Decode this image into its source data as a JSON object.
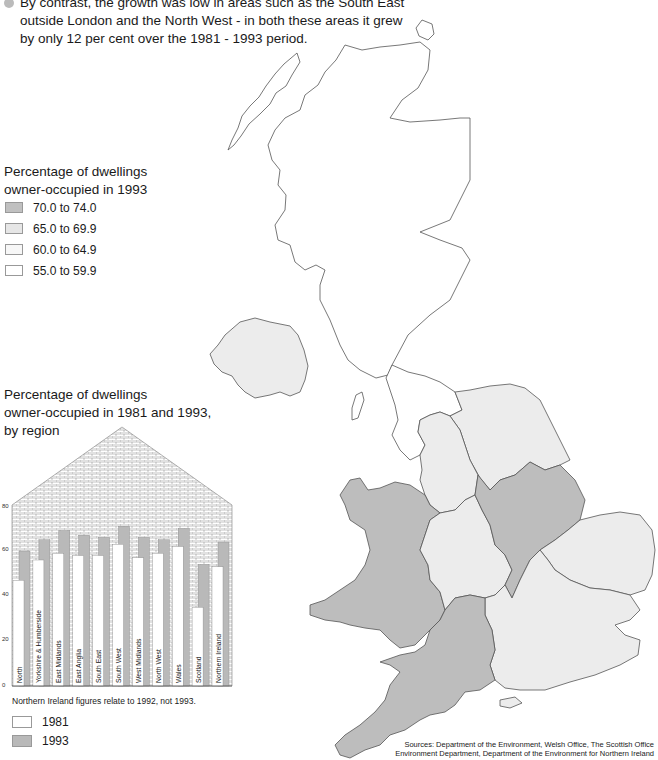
{
  "intro": {
    "lines": [
      "By contrast, the growth was low in areas such as the South East",
      "outside London and the North West - in both these areas it grew",
      "by only 12 per cent over the 1981 - 1993 period."
    ]
  },
  "map_legend": {
    "title_line1": "Percentage of dwellings",
    "title_line2": "owner-occupied in 1993",
    "items": [
      {
        "label": "70.0 to 74.0",
        "color": "#c0c0c0"
      },
      {
        "label": "65.0 to 69.9",
        "color": "#e6e6e6"
      },
      {
        "label": "60.0 to 64.9",
        "color": "#f7f7f7"
      },
      {
        "label": "55.0 to 59.9",
        "color": "#ffffff"
      }
    ]
  },
  "map": {
    "region_colors": {
      "dark": "#bdbdbd",
      "light": "#ececec",
      "white": "#ffffff",
      "outline": "#555555"
    }
  },
  "chart_title": {
    "line1": "Percentage of dwellings",
    "line2": "owner-occupied in 1981 and 1993,",
    "line3": "by region"
  },
  "chart_note": "Northern Ireland figures relate to 1992, not 1993.",
  "chart_legend": [
    {
      "label": "1981",
      "color": "#ffffff"
    },
    {
      "label": "1993",
      "color": "#b9b9b9"
    }
  ],
  "sources": {
    "line1": "Sources: Department of the Environment, Welsh Office, The Scottish Office",
    "line2": "Environment Department, Department of the Environment for Northern Ireland"
  },
  "chart_data": {
    "type": "bar",
    "title": "Percentage of dwellings owner-occupied in 1981 and 1993, by region",
    "xlabel": "",
    "ylabel": "",
    "ylim": [
      0,
      80
    ],
    "yticks": [
      0,
      20,
      40,
      60,
      80
    ],
    "grid": false,
    "legend_position": "bottom-left",
    "categories": [
      "North",
      "Yorkshire & Humberside",
      "East Midlands",
      "East Anglia",
      "South East",
      "South West",
      "West Midlands",
      "North West",
      "Wales",
      "Scotland",
      "Northern Ireland"
    ],
    "series": [
      {
        "name": "1981",
        "values": [
          47,
          56,
          59,
          58,
          58,
          63,
          57,
          59,
          62,
          35,
          53
        ]
      },
      {
        "name": "1993",
        "values": [
          60,
          65,
          69,
          67,
          66,
          71,
          66,
          65,
          70,
          54,
          64
        ]
      }
    ],
    "annotations": [
      "Northern Ireland figures relate to 1992, not 1993."
    ]
  }
}
